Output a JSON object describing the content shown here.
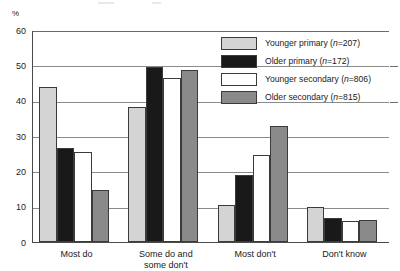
{
  "chart_data": {
    "type": "bar",
    "title": "",
    "xlabel": "",
    "ylabel": "%",
    "ylim": [
      0,
      60
    ],
    "yticks": [
      0,
      10,
      20,
      30,
      40,
      50,
      60
    ],
    "grid": true,
    "legend_position": "top-right",
    "categories": [
      "Most do",
      "Some do and\nsome don't",
      "Most don't",
      "Don't know"
    ],
    "category_lines": [
      [
        "Most do"
      ],
      [
        "Some do and",
        "some don't"
      ],
      [
        "Most don't"
      ],
      [
        "Don't know"
      ]
    ],
    "series": [
      {
        "name": "Younger primary (n=207)",
        "label_main": "Younger primary",
        "label_n": "n=207",
        "color": "#d4d4d4",
        "values": [
          44,
          38.3,
          10.5,
          9.9
        ]
      },
      {
        "name": "Older primary (n=172)",
        "label_main": "Older primary",
        "label_n": "n=172",
        "color": "#191919",
        "values": [
          26.5,
          49.4,
          19.1,
          6.9
        ]
      },
      {
        "name": "Younger secondary (n=806)",
        "label_main": "Younger secondary",
        "label_n": "n=806",
        "color": "#ffffff",
        "values": [
          25.6,
          46.4,
          24.7,
          6.0
        ]
      },
      {
        "name": "Older secondary (n=815)",
        "label_main": "Older secondary",
        "label_n": "n=815",
        "color": "#8a8a8a",
        "values": [
          14.6,
          48.7,
          32.9,
          6.3
        ]
      }
    ]
  },
  "axis": {
    "unit_label": "%"
  },
  "legend": {
    "entries": [
      {
        "label_main": "Younger primary",
        "label_n": "n=207",
        "swatch": "#d4d4d4"
      },
      {
        "label_main": "Older primary",
        "label_n": "n=172",
        "swatch": "#191919"
      },
      {
        "label_main": "Younger secondary",
        "label_n": "n=806",
        "swatch": "#ffffff"
      },
      {
        "label_main": "Older secondary",
        "label_n": "n=815",
        "swatch": "#8a8a8a"
      }
    ]
  }
}
